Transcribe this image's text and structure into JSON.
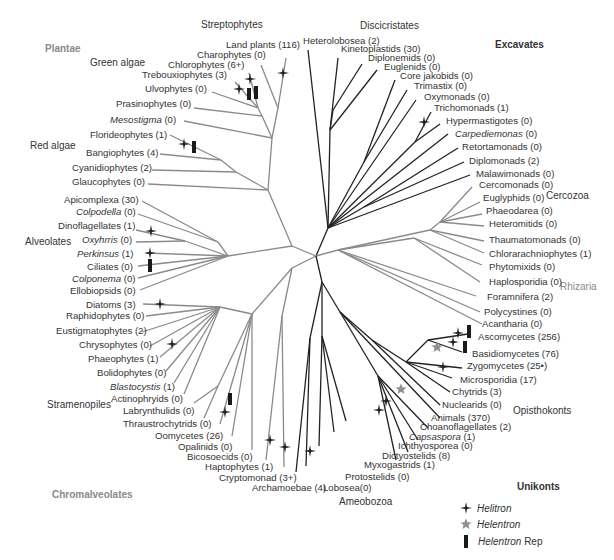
{
  "super_groups": {
    "plantae": "Plantae",
    "excavates": "Excavates",
    "chromalveolates": "Chromalveolates",
    "unikonts": "Unikonts",
    "rhizaria": "Rhizaria"
  },
  "groups": {
    "streptophytes": "Streptophytes",
    "discicristates": "Discicristates",
    "green_algae": "Green algae",
    "red_algae": "Red algae",
    "alveolates": "Alveolates",
    "stramenopiles": "Stramenopiles",
    "cercozoa": "Cercozoa",
    "opisthokonts": "Opisthokonts",
    "ameobozoa": "Ameobozoa"
  },
  "taxa": {
    "land_plants": "Land plants (116)",
    "charophytes": "Charophytes (0)",
    "chlorophytes": "Chlorophytes (6+)",
    "trebouxiophytes": "Trebouxiophytes (3)",
    "ulvophytes": "Ulvophytes (0)",
    "prasinophytes": "Prasinophytes (0)",
    "mesostigma_name": "Mesostigma",
    "mesostigma_count": " (0)",
    "florideophytes": "Florideophytes (1)",
    "bangiophytes": "Bangiophytes (4)",
    "cyanidiophytes": "Cyanidiophytes (2)",
    "glaucophytes": "Glaucophytes (0)",
    "apicomplexa": "Apicomplexa (30)",
    "colpodella_name": "Colpodella",
    "colpodella_count": " (0)",
    "dinoflagellates": "Dinoflagellates (1)",
    "oxyhrris_name": "Oxyhrris",
    "oxyhrris_count": " (0)",
    "perkinsus_name": "Perkinsus",
    "perkinsus_count": " (1)",
    "ciliates": "Ciliates (0)",
    "colponema_name": "Colponema",
    "colponema_count": " (0)",
    "ellobiopsids": "Ellobiopsids (0)",
    "diatoms": "Diatoms (3)",
    "raphidophytes": "Raphidophytes (0)",
    "eustigmatophytes": "Eustigmatophytes (2)",
    "chrysophytes": "Chrysophytes (0)",
    "phaeophytes": "Phaeophytes (1)",
    "bolidophytes": "Bolidophytes (0)",
    "blastocystis_name": "Blastocystis",
    "blastocystis_count": " (1)",
    "actinophryids": "Actinophryids (0)",
    "labrynthulids": "Labrynthulids (0)",
    "thraustrochytrids": "Thraustrochytrids (0)",
    "oomycetes": "Oomycetes (26)",
    "opalinids": "Opalinids (0)",
    "bicosoecids": "Bicosoecids (0)",
    "haptophytes": "Haptophytes (1)",
    "cryptomonad": "Cryptomonad (3+)",
    "archamoebae": "Archamoebae (4)",
    "lobosea": "Lobosea(0)",
    "protostelids": "Protostelids (0)",
    "myxogastrids": "Myxogastrids (1)",
    "dictyostelids": "Dictyostelids (8)",
    "ichthyosporea": "Ichthyosporea (0)",
    "capsaspora_name": "Capsaspora",
    "capsaspora_count": " (1)",
    "choanoflagellates": "Choanoflagellates (2)",
    "animals": "Animals (370)",
    "nuclearids": "Nuclearids (0)",
    "chytrids": "Chytrids (3)",
    "microsporidia": "Microsporidia (17)",
    "zygomycetes": "Zygomycetes (25•)",
    "basidiomycetes": "Basidiomycetes (76)",
    "ascomycetes": "Ascomycetes (256)",
    "acantharia": "Acantharia (0)",
    "polycystines": "Polycystines (0)",
    "foramnifera": "Foramnifera (2)",
    "haplosporidia": "Haplosporidia (0)",
    "phytomixids": "Phytomixids (0)",
    "chlorarachniophytes": "Chlorarachniophytes (1)",
    "thaumatomonads": "Thaumatomonads (0)",
    "heteromitids": "Heteromitids (0)",
    "phaeodarea": "Phaeodarea (0)",
    "euglyphids": "Euglyphids (0)",
    "cercomonads": "Cercomonads (0)",
    "malawimonads": "Malawimonads (0)",
    "diplomonads": "Diplomonads (2)",
    "retortamonads": "Retortamonads (0)",
    "carpediemonas_name": "Carpediemonas",
    "carpediemonas_count": " (0)",
    "hypermastigotes": "Hypermastigotes (0)",
    "trichomonads": "Trichomonads (1)",
    "oxymonads": "Oxymonads (0)",
    "trimastix": "Trimastix (0)",
    "core_jakobids": "Core jakobids (0)",
    "euglenids": "Euglenids (0)",
    "diplonemids": "Diplonemids (0)",
    "kinetoplastids": "Kinetoplastids (30)",
    "heterolobosea": "Heterolobosea (2)"
  },
  "legend": {
    "helitron": "Helitron",
    "helentron": "Helentron",
    "helentron_rep_name": "Helentron",
    "helentron_rep_suffix": " Rep"
  },
  "colors": {
    "black_branch": "#222222",
    "gray_branch": "#8a8a8a",
    "label_text": "#333333",
    "supergroup_gray": "#8a8a8a",
    "helentron_star": "#909090"
  }
}
